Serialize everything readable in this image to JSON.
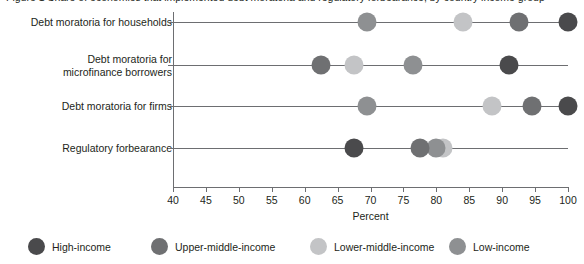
{
  "chart_data": {
    "type": "scatter",
    "variant": "horizontal-dot-plot",
    "title": "Figure 1  Share of economies that implemented debt moratoria and regulatory forbearance, by country income group",
    "xlabel": "Percent",
    "ylabel": "",
    "xlim": [
      40,
      100
    ],
    "xticks": [
      40,
      45,
      50,
      55,
      60,
      65,
      70,
      75,
      80,
      85,
      90,
      95,
      100
    ],
    "grid": false,
    "legend_position": "bottom",
    "categories": [
      "Debt moratoria for households",
      "Debt moratoria for\nmicrofinance borrowers",
      "Debt moratoria for firms",
      "Regulatory forbearance"
    ],
    "series": [
      {
        "name": "High-income",
        "color": "#4a4a4c",
        "values": [
          100.0,
          91.0,
          100.0,
          67.5
        ]
      },
      {
        "name": "Upper-middle-income",
        "color": "#6f7072",
        "values": [
          92.5,
          62.5,
          94.5,
          77.5
        ]
      },
      {
        "name": "Lower-middle-income",
        "color": "#c3c4c6",
        "values": [
          84.0,
          67.5,
          88.5,
          81.0
        ]
      },
      {
        "name": "Low-income",
        "color": "#8e9092",
        "values": [
          69.5,
          76.5,
          69.5,
          80.0
        ]
      }
    ]
  },
  "legend": {
    "items": [
      {
        "label": "High-income"
      },
      {
        "label": "Upper-middle-income"
      },
      {
        "label": "Lower-middle-income"
      },
      {
        "label": "Low-income"
      }
    ]
  },
  "axis": {
    "x_title": "Percent"
  }
}
